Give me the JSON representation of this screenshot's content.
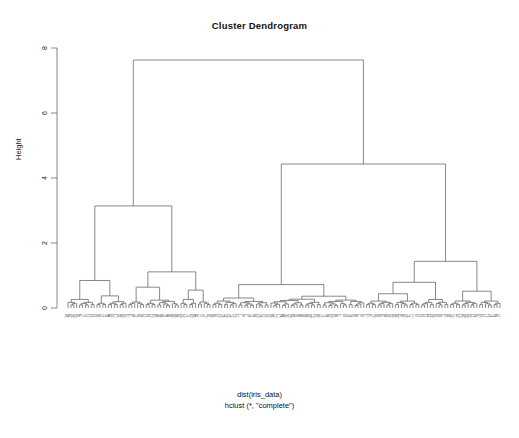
{
  "chart_data": {
    "type": "dendrogram",
    "title": "Cluster Dendrogram",
    "ylabel": "Height",
    "xlabel": "",
    "caption_line1": "dist(iris_data)",
    "caption_line2": "hclust (*, \"complete\")",
    "ylim": [
      0,
      8
    ],
    "yticks": [
      0,
      2,
      4,
      6,
      8
    ],
    "ytick_labels": [
      "0",
      "2",
      "4",
      "6",
      "8"
    ],
    "grid": false,
    "legend": "none",
    "n_leaves": 150,
    "linkage": "complete",
    "distance": "euclidean",
    "dataset": "iris_data",
    "root_height": 7.63,
    "line_color": "#555555",
    "background": "#ffffff",
    "major_merges": [
      {
        "height": 7.63,
        "left_x": 151,
        "right_x": 382,
        "label": "root"
      },
      {
        "height": 3.14,
        "left_x": 92,
        "right_x": 207,
        "label": "left-cluster"
      },
      {
        "height": 4.43,
        "left_x": 305,
        "right_x": 455,
        "label": "right-cluster"
      },
      {
        "height": 1.65,
        "left_x": 80,
        "right_x": 105,
        "label": "L1"
      },
      {
        "height": 1.55,
        "left_x": 172,
        "right_x": 240,
        "label": "L2"
      },
      {
        "height": 1.4,
        "left_x": 236,
        "right_x": 262,
        "label": "L3"
      },
      {
        "height": 1.25,
        "left_x": 286,
        "right_x": 330,
        "label": "R1"
      },
      {
        "height": 1.8,
        "left_x": 438,
        "right_x": 476,
        "label": "R2"
      }
    ],
    "leaf_heights_note": "all leaves terminate at height 0",
    "cluster_sizes": [
      50,
      100
    ]
  },
  "axis": {
    "tick_0": "0",
    "tick_2": "2",
    "tick_4": "4",
    "tick_6": "6",
    "tick_8": "8"
  }
}
